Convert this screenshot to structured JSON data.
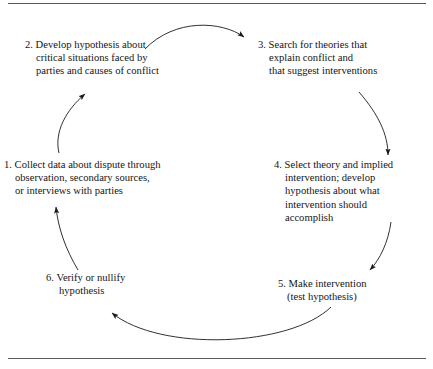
{
  "figure": {
    "border_color": "#5a5a5a",
    "text_color": "#151515",
    "background": "#ffffff"
  },
  "steps": [
    {
      "id": "step-1",
      "number": "1.",
      "lines": [
        "1. Collect data about dispute through",
        "observation, secondary sources,",
        "or interviews with parties"
      ]
    },
    {
      "id": "step-2",
      "number": "2.",
      "lines": [
        "2. Develop hypothesis about",
        "critical situations faced by",
        "parties and causes of conflict"
      ]
    },
    {
      "id": "step-3",
      "number": "3.",
      "lines": [
        "3. Search for theories that",
        "explain conflict and",
        "that suggest interventions"
      ]
    },
    {
      "id": "step-4",
      "number": "4.",
      "lines": [
        "4. Select theory and implied",
        "intervention; develop",
        "hypothesis about what",
        "intervention should",
        "accomplish"
      ]
    },
    {
      "id": "step-5",
      "number": "5.",
      "lines": [
        "5. Make intervention",
        "(test hypothesis)"
      ]
    },
    {
      "id": "step-6",
      "number": "6.",
      "lines": [
        "6. Verify or nullify",
        "hypothesis"
      ]
    }
  ],
  "arrows": [
    {
      "name": "arrow-1-to-2",
      "from": "1",
      "to": "2",
      "direction": "up-right"
    },
    {
      "name": "arrow-2-to-3",
      "from": "2",
      "to": "3",
      "direction": "right"
    },
    {
      "name": "arrow-3-to-4",
      "from": "3",
      "to": "4",
      "direction": "down"
    },
    {
      "name": "arrow-4-to-5",
      "from": "4",
      "to": "5",
      "direction": "down-left"
    },
    {
      "name": "arrow-5-to-6",
      "from": "5",
      "to": "6",
      "direction": "left"
    },
    {
      "name": "arrow-6-to-1",
      "from": "6",
      "to": "1",
      "direction": "up"
    }
  ]
}
